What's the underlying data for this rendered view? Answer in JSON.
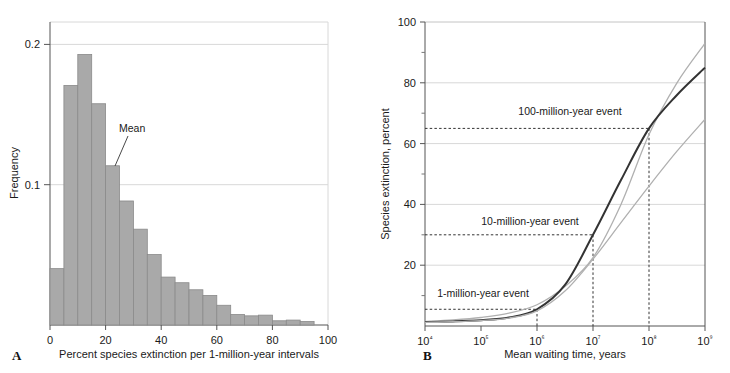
{
  "figure": {
    "panel_a_letter": "A",
    "panel_b_letter": "B",
    "caption_fragment": ""
  },
  "chart_data": [
    {
      "type": "bar",
      "panel": "A",
      "title": "",
      "xlabel": "Percent species extinction per 1-million-year intervals",
      "ylabel": "Frequency",
      "xlim": [
        0,
        100
      ],
      "ylim": [
        0,
        0.215
      ],
      "xticks": [
        0,
        20,
        40,
        60,
        80,
        100
      ],
      "xticklabels": [
        "0",
        "20",
        "40",
        "60",
        "80",
        "100"
      ],
      "yticks": [
        0.1,
        0.2
      ],
      "yticklabels": [
        "0.1",
        "0.2"
      ],
      "grid": "horizontal",
      "bin_width": 5,
      "categories": [
        "0-5",
        "5-10",
        "10-15",
        "15-20",
        "20-25",
        "25-30",
        "30-35",
        "35-40",
        "40-45",
        "45-50",
        "50-55",
        "55-60",
        "60-65",
        "65-70",
        "70-75",
        "75-80",
        "80-85",
        "85-90",
        "90-95"
      ],
      "values": [
        0.04,
        0.17,
        0.192,
        0.157,
        0.113,
        0.088,
        0.068,
        0.05,
        0.034,
        0.03,
        0.025,
        0.021,
        0.014,
        0.0075,
        0.0065,
        0.007,
        0.003,
        0.0035,
        0.0025
      ],
      "bar_color": "#a9a9a9",
      "annotations": [
        {
          "label": "Mean",
          "points_to_bin": "20-25"
        }
      ]
    },
    {
      "type": "line",
      "panel": "B",
      "title": "",
      "xlabel": "Mean waiting time, years",
      "ylabel": "Species extinction, percent",
      "xscale": "log",
      "xlim": [
        10000,
        1000000000
      ],
      "ylim": [
        0,
        100
      ],
      "xticks": [
        10000,
        100000,
        1000000,
        10000000,
        100000000,
        1000000000
      ],
      "xticklabels": [
        "10⁴",
        "10⁵",
        "10⁶",
        "10⁷",
        "10⁸",
        "10⁹"
      ],
      "yticks": [
        20,
        40,
        60,
        80,
        100
      ],
      "yticklabels": [
        "20",
        "40",
        "60",
        "80",
        "100"
      ],
      "yminorticks": [
        10,
        30,
        50,
        70,
        90
      ],
      "grid": "horizontal",
      "series": [
        {
          "name": "upper bound",
          "style": "thin-gray",
          "x": [
            10000,
            31600,
            100000,
            316000,
            1000000,
            3160000,
            10000000,
            31600000,
            100000000,
            316000000,
            1000000000
          ],
          "values": [
            1.5,
            2.0,
            2.8,
            4.2,
            7.0,
            13.0,
            22.5,
            40.0,
            63.0,
            80.0,
            93.0
          ]
        },
        {
          "name": "median",
          "style": "thick-dark",
          "x": [
            10000,
            31600,
            100000,
            316000,
            1000000,
            3160000,
            10000000,
            31600000,
            100000000,
            316000000,
            1000000000
          ],
          "values": [
            1.3,
            1.5,
            1.9,
            2.8,
            5.5,
            13.5,
            30.0,
            48.0,
            65.0,
            76.0,
            85.0
          ]
        },
        {
          "name": "lower bound",
          "style": "thin-gray",
          "x": [
            10000,
            31600,
            100000,
            316000,
            1000000,
            3160000,
            10000000,
            31600000,
            100000000,
            316000000,
            1000000000
          ],
          "values": [
            1.2,
            1.4,
            1.8,
            2.6,
            5.0,
            11.5,
            22.0,
            34.0,
            46.0,
            57.5,
            68.0
          ]
        }
      ],
      "annotations": [
        {
          "label": "100-million-year event",
          "x": 100000000,
          "y": 65
        },
        {
          "label": "10-million-year event",
          "x": 10000000,
          "y": 30
        },
        {
          "label": "1-million-year event",
          "x": 1000000,
          "y": 5.5
        }
      ]
    }
  ]
}
